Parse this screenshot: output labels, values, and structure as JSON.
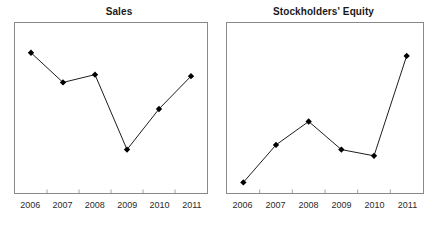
{
  "figure": {
    "background_color": "#ffffff",
    "frame_color": "#8a8a8a",
    "series_color": "#000000",
    "marker_shape": "diamond"
  },
  "chart_data": [
    {
      "type": "line",
      "title": "Sales",
      "xlabel": "",
      "ylabel": "",
      "grid": false,
      "legend": "none",
      "marker": "diamond",
      "categories": [
        "2006",
        "2007",
        "2008",
        "2009",
        "2010",
        "2011"
      ],
      "values": [
        0.86,
        0.67,
        0.72,
        0.24,
        0.5,
        0.71
      ],
      "ylim": [
        0,
        1
      ]
    },
    {
      "type": "line",
      "title": "Stockholders' Equity",
      "xlabel": "",
      "ylabel": "",
      "grid": false,
      "legend": "none",
      "marker": "diamond",
      "categories": [
        "2006",
        "2007",
        "2008",
        "2009",
        "2010",
        "2011"
      ],
      "values": [
        0.03,
        0.27,
        0.42,
        0.24,
        0.2,
        0.84
      ],
      "ylim": [
        0,
        1
      ]
    }
  ]
}
